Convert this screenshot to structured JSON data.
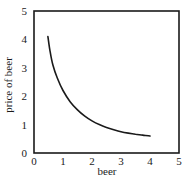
{
  "chart_data": {
    "type": "line",
    "title": "",
    "xlabel": "beer",
    "ylabel": "price of beer",
    "xlim": [
      0,
      5
    ],
    "ylim": [
      0,
      5
    ],
    "x_ticks": [
      "0",
      "1",
      "2",
      "3",
      "4",
      "5"
    ],
    "y_ticks": [
      "0",
      "1",
      "2",
      "3",
      "4",
      "5"
    ],
    "grid": false,
    "legend": null,
    "series": [
      {
        "name": "demand curve",
        "color": "#1a1a1a",
        "x": [
          0.48,
          0.55,
          0.65,
          0.8,
          1.0,
          1.25,
          1.5,
          1.75,
          2.0,
          2.25,
          2.5,
          2.75,
          3.0,
          3.25,
          3.5,
          3.75,
          4.0
        ],
        "y": [
          4.1,
          3.6,
          3.1,
          2.65,
          2.2,
          1.8,
          1.52,
          1.3,
          1.13,
          1.0,
          0.9,
          0.82,
          0.75,
          0.7,
          0.66,
          0.63,
          0.6
        ]
      }
    ]
  }
}
